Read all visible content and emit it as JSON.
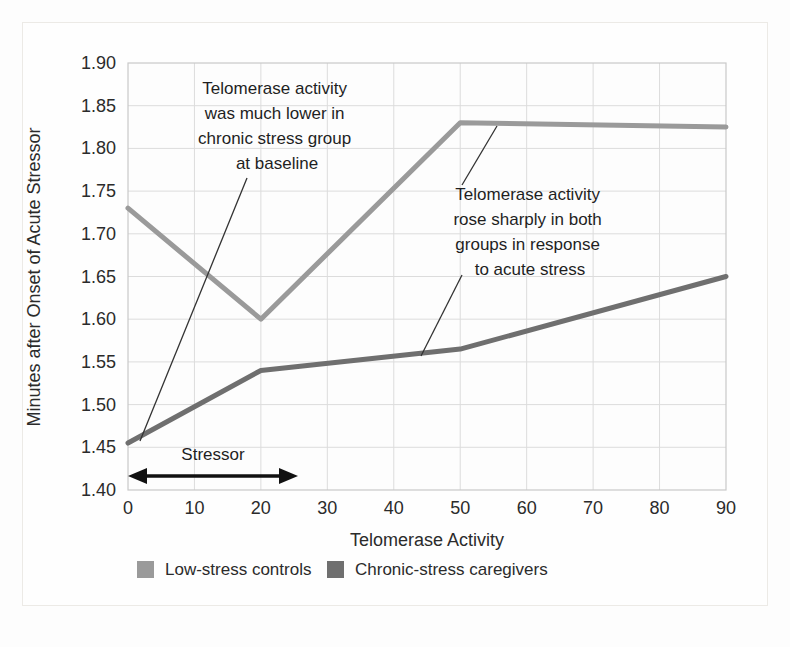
{
  "chart_data": {
    "type": "line",
    "title": "",
    "xlabel": "Telomerase Activity",
    "ylabel": "Minutes after Onset of Acute Stressor",
    "xlim": [
      0,
      90
    ],
    "ylim": [
      1.4,
      1.9
    ],
    "xticks": [
      "0",
      "10",
      "20",
      "30",
      "40",
      "50",
      "60",
      "70",
      "80",
      "90"
    ],
    "yticks": [
      "1.90",
      "1.85",
      "1.80",
      "1.75",
      "1.70",
      "1.65",
      "1.60",
      "1.55",
      "1.50",
      "1.45",
      "1.40"
    ],
    "grid": true,
    "legend_position": "bottom",
    "series": [
      {
        "name": "Low-stress controls",
        "color": "#9a9a9a",
        "x": [
          0,
          20,
          50,
          90
        ],
        "values": [
          1.73,
          1.6,
          1.83,
          1.825
        ]
      },
      {
        "name": "Chronic-stress caregivers",
        "color": "#6f6f6f",
        "x": [
          0,
          20,
          50,
          90
        ],
        "values": [
          1.455,
          1.54,
          1.565,
          1.65
        ]
      }
    ],
    "annotations": [
      {
        "id": "baseline-annotation",
        "lines": [
          "Telomerase activity",
          "was much lower in",
          "chronic stress group",
          "at baseline"
        ],
        "pointer_from": [
          247,
          178
        ],
        "pointer_to": [
          140,
          441
        ]
      },
      {
        "id": "acute-stress-annotation",
        "lines": [
          "Telomerase activity",
          "rose sharply in both",
          "groups in response",
          "to acute stress"
        ],
        "pointer_up_from": [
          462,
          185
        ],
        "pointer_up_to": [
          497,
          126
        ],
        "pointer_down_from": [
          462,
          273
        ],
        "pointer_down_to": [
          420,
          355
        ]
      }
    ],
    "span_marker": {
      "label": "Stressor",
      "x_start": 0,
      "x_end": 22
    }
  },
  "legend": {
    "items": [
      {
        "label": "Low-stress controls",
        "color": "#9a9a9a"
      },
      {
        "label": "Chronic-stress caregivers",
        "color": "#6f6f6f"
      }
    ]
  },
  "colors": {
    "low_stress": "#9a9a9a",
    "chronic_stress": "#6f6f6f",
    "grid": "#dcdcdc",
    "axis": "#b8b8b8",
    "text": "#1f1f1f",
    "background": "#fefefe"
  }
}
